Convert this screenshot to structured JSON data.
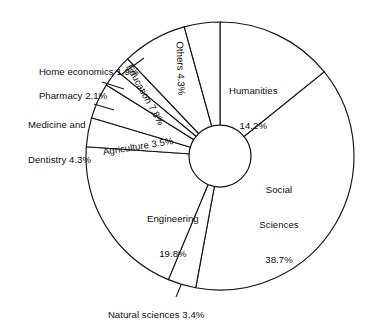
{
  "figure": {
    "kind": "donut-pie-chart",
    "background_color": "#ffffff",
    "line_color": "#151515",
    "slice_fill": "#ffffff"
  },
  "chart_data": {
    "type": "pie",
    "title": "",
    "subtitle": "",
    "xlabel": "",
    "ylabel": "",
    "donut": true,
    "inner_radius_ratio": 0.232,
    "start_angle_deg": 0,
    "direction": "clockwise",
    "legend": "none",
    "grid": false,
    "value_unit": "%",
    "labels_inside_slice": [
      "Education 7.8%",
      "Others 4.3%",
      "Humanities 14.2%",
      "Social Sciences 38.7%",
      "Engineering 19.8%",
      "Agriculture 3.5%"
    ],
    "labels_with_leader_lines": [
      "Home economics 1.9%",
      "Pharmacy 2.1%",
      "Medicine and Dentistry 4.3%",
      "Natural sciences 3.4%"
    ],
    "categories": [
      "Humanities",
      "Social Sciences",
      "Natural sciences",
      "Engineering",
      "Agriculture",
      "Medicine and Dentistry",
      "Pharmacy",
      "Home economics",
      "Education",
      "Others"
    ],
    "values": [
      14.2,
      38.7,
      3.4,
      19.8,
      3.5,
      4.3,
      2.1,
      1.9,
      7.8,
      4.3
    ],
    "total": 100.0,
    "slices": [
      {
        "label": "Humanities",
        "value": 14.2,
        "label_lines": [
          "Humanities",
          "14.2%"
        ]
      },
      {
        "label": "Social Sciences",
        "value": 38.7,
        "label_lines": [
          "Social",
          "Sciences",
          "38.7%"
        ]
      },
      {
        "label": "Natural sciences",
        "value": 3.4,
        "label_lines": [
          "Natural sciences 3.4%"
        ]
      },
      {
        "label": "Engineering",
        "value": 19.8,
        "label_lines": [
          "Engineering",
          "19.8%"
        ]
      },
      {
        "label": "Agriculture",
        "value": 3.5,
        "label_lines": [
          "Agriculture 3.5%"
        ]
      },
      {
        "label": "Medicine and Dentistry",
        "value": 4.3,
        "label_lines": [
          "Medicine and",
          "Dentistry 4.3%"
        ]
      },
      {
        "label": "Pharmacy",
        "value": 2.1,
        "label_lines": [
          "Pharmacy 2.1%"
        ]
      },
      {
        "label": "Home economics",
        "value": 1.9,
        "label_lines": [
          "Home economics 1.9%"
        ]
      },
      {
        "label": "Education",
        "value": 7.8,
        "label_lines": [
          "Education 7.8%"
        ]
      },
      {
        "label": "Others",
        "value": 4.3,
        "label_lines": [
          "Others 4.3%"
        ]
      }
    ]
  },
  "labels": {
    "humanities_l1": "Humanities",
    "humanities_l2": "14.2%",
    "social_l1": "Social",
    "social_l2": "Sciences",
    "social_l3": "38.7%",
    "natural": "Natural sciences 3.4%",
    "engineering_l1": "Engineering",
    "engineering_l2": "19.8%",
    "agriculture": "Agriculture 3.5%",
    "medicine_l1": "Medicine and",
    "medicine_l2": "Dentistry 4.3%",
    "pharmacy": "Pharmacy 2.1%",
    "home_economics": "Home economics 1.9%",
    "education": "Education 7.8%",
    "others": "Others 4.3%"
  }
}
